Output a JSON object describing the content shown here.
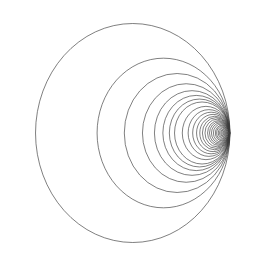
{
  "figure": {
    "title": "",
    "background_color": "#ffffff",
    "width": 266,
    "height": 274
  },
  "axes": {
    "frame_color": "#6b6b6b",
    "left_px": 24,
    "right_px": 248,
    "top_px": 13,
    "bottom_px": 252,
    "x_zero_px": 181,
    "y_zero_px": 133,
    "px_per_unit_x": 32.4,
    "px_per_unit_y": 36.5
  },
  "chart_data": {
    "type": "line",
    "title": "",
    "xlabel": "",
    "ylabel": "",
    "xlim": [
      -4.85,
      2.07
    ],
    "ylim": [
      -3.26,
      3.29
    ],
    "grid": false,
    "legend": null,
    "xticks": [
      -4,
      -3,
      -2,
      -1,
      0,
      1,
      2
    ],
    "xticklabels": [
      "-4",
      "-3",
      "-2",
      "-1",
      "0",
      "1",
      "2"
    ],
    "yticks": [
      -3,
      -2,
      -1,
      0,
      1,
      2,
      3
    ],
    "yticklabels": [
      "-3",
      "-2",
      "-1",
      "0",
      "1",
      "2",
      "3"
    ],
    "series": [
      {
        "name": "apollonius-circles",
        "kind": "circles",
        "stroke": "#3a3a3a",
        "converge_x": 1.5,
        "circles": [
          {
            "cx": -1.49,
            "cy": 0.0,
            "r": 3.0
          },
          {
            "cx": -0.54,
            "cy": 0.0,
            "r": 2.05
          },
          {
            "cx": -0.12,
            "cy": 0.0,
            "r": 1.63
          },
          {
            "cx": 0.16,
            "cy": 0.0,
            "r": 1.35
          },
          {
            "cx": 0.34,
            "cy": 0.0,
            "r": 1.16
          },
          {
            "cx": 0.47,
            "cy": 0.0,
            "r": 1.03
          },
          {
            "cx": 0.57,
            "cy": 0.0,
            "r": 0.93
          },
          {
            "cx": 0.65,
            "cy": 0.0,
            "r": 0.85
          },
          {
            "cx": 0.77,
            "cy": 0.0,
            "r": 0.73
          },
          {
            "cx": 0.86,
            "cy": 0.0,
            "r": 0.64
          },
          {
            "cx": 0.93,
            "cy": 0.0,
            "r": 0.57
          },
          {
            "cx": 0.99,
            "cy": 0.0,
            "r": 0.51
          },
          {
            "cx": 1.04,
            "cy": 0.0,
            "r": 0.46
          },
          {
            "cx": 1.08,
            "cy": 0.0,
            "r": 0.42
          },
          {
            "cx": 1.12,
            "cy": 0.0,
            "r": 0.38
          },
          {
            "cx": 1.16,
            "cy": 0.0,
            "r": 0.34
          },
          {
            "cx": 1.19,
            "cy": 0.0,
            "r": 0.31
          },
          {
            "cx": 1.22,
            "cy": 0.0,
            "r": 0.28
          },
          {
            "cx": 1.25,
            "cy": 0.0,
            "r": 0.25
          },
          {
            "cx": 1.28,
            "cy": 0.0,
            "r": 0.22
          },
          {
            "cx": 1.3,
            "cy": 0.0,
            "r": 0.2
          },
          {
            "cx": 1.325,
            "cy": 0.0,
            "r": 0.175
          },
          {
            "cx": 1.345,
            "cy": 0.0,
            "r": 0.155
          },
          {
            "cx": 1.365,
            "cy": 0.0,
            "r": 0.135
          },
          {
            "cx": 1.382,
            "cy": 0.0,
            "r": 0.118
          },
          {
            "cx": 1.398,
            "cy": 0.0,
            "r": 0.102
          },
          {
            "cx": 1.412,
            "cy": 0.0,
            "r": 0.088
          },
          {
            "cx": 1.425,
            "cy": 0.0,
            "r": 0.075
          },
          {
            "cx": 1.437,
            "cy": 0.0,
            "r": 0.063
          },
          {
            "cx": 1.448,
            "cy": 0.0,
            "r": 0.052
          },
          {
            "cx": 1.457,
            "cy": 0.0,
            "r": 0.043
          },
          {
            "cx": 1.465,
            "cy": 0.0,
            "r": 0.035
          },
          {
            "cx": 1.472,
            "cy": 0.0,
            "r": 0.028
          },
          {
            "cx": 1.478,
            "cy": 0.0,
            "r": 0.022
          },
          {
            "cx": 1.483,
            "cy": 0.0,
            "r": 0.017
          },
          {
            "cx": 1.487,
            "cy": 0.0,
            "r": 0.013
          },
          {
            "cx": 1.491,
            "cy": 0.0,
            "r": 0.009
          }
        ]
      }
    ],
    "annotations": [
      {
        "name": "asymptote",
        "type": "vline",
        "x": 1.5,
        "style": "dashed",
        "color": "#6b6b6b"
      },
      {
        "name": "plus-marker",
        "type": "marker",
        "symbol": "+",
        "x": 0.0,
        "y": 0.0,
        "color": "#000000"
      },
      {
        "name": "dot-marker",
        "type": "marker",
        "symbol": "square-filled",
        "x": 1.0,
        "y": 0.0,
        "color": "#000000"
      }
    ]
  }
}
